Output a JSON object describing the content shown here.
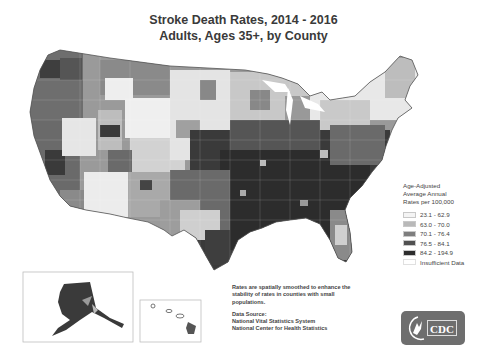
{
  "title": {
    "line1": "Stroke Death Rates, 2014 - 2016",
    "line2": "Adults, Ages 35+, by County"
  },
  "legend": {
    "heading_lines": [
      "Age-Adjusted",
      "Average Annual",
      "Rates per 100,000"
    ],
    "items": [
      {
        "label": "23.1 - 62.9",
        "color": "#f4f4f4"
      },
      {
        "label": "63.0 - 70.0",
        "color": "#b9b9b9"
      },
      {
        "label": "70.1 - 76.4",
        "color": "#7e7e7e"
      },
      {
        "label": "76.5 - 84.1",
        "color": "#505050"
      },
      {
        "label": "84.2 - 194.9",
        "color": "#2c2c2c"
      },
      {
        "label": "Insufficient Data",
        "color": "#ffffff"
      }
    ]
  },
  "note": {
    "smoothing": "Rates are spatially smoothed to enhance the stability of rates in counties with small populations.",
    "source_heading": "Data Source:",
    "source_lines": [
      "National Vital Statistics System",
      "National Center for Health Statistics"
    ]
  },
  "insets": {
    "alaska": "Alaska",
    "hawaii": "Hawaii"
  },
  "logo": {
    "text": "CDC"
  },
  "colors": {
    "title": "#3a3a3a",
    "border": "#bdbdbd"
  }
}
